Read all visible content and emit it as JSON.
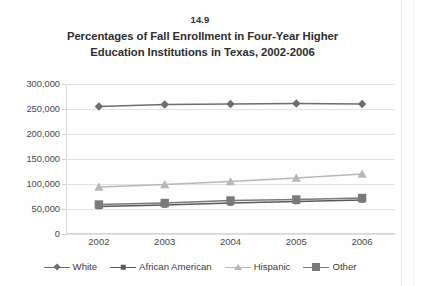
{
  "figure_number": "14.9",
  "chart_data": {
    "type": "line",
    "title": "Percentages of Fall Enrollment in Four-Year Higher Education Institutions in Texas, 2002-2006",
    "title_line1": "Percentages of Fall Enrollment in Four-Year Higher",
    "title_line2": "Education Institutions in Texas, 2002-2006",
    "xlabel": "",
    "ylabel": "",
    "categories": [
      "2002",
      "2003",
      "2004",
      "2005",
      "2006"
    ],
    "x": [
      2002,
      2003,
      2004,
      2005,
      2006
    ],
    "ylim": [
      0,
      300000
    ],
    "ytick_values": [
      0,
      50000,
      100000,
      150000,
      200000,
      250000,
      300000
    ],
    "ytick_labels": [
      "0",
      "50,000",
      "100,000",
      "150,000",
      "200,000",
      "250,000",
      "300,000"
    ],
    "grid": true,
    "legend_position": "bottom",
    "series": [
      {
        "name": "White",
        "marker": "diamond",
        "color": "#6e6e6e",
        "values": [
          255000,
          259000,
          260000,
          261000,
          260000
        ]
      },
      {
        "name": "African American",
        "marker": "square-small",
        "color": "#5a5a5a",
        "values": [
          55000,
          58000,
          62000,
          65000,
          68000
        ]
      },
      {
        "name": "Hispanic",
        "marker": "triangle",
        "color": "#b8b8b8",
        "values": [
          94000,
          99000,
          105000,
          112000,
          120000
        ]
      },
      {
        "name": "Other",
        "marker": "square-large",
        "color": "#7a7a7a",
        "values": [
          59000,
          62000,
          67000,
          69000,
          72000
        ]
      }
    ]
  },
  "legend": {
    "items": [
      {
        "label": "White",
        "marker": "diamond",
        "color": "#6e6e6e"
      },
      {
        "label": "African American",
        "marker": "square-small",
        "color": "#5a5a5a"
      },
      {
        "label": "Hispanic",
        "marker": "triangle",
        "color": "#b8b8b8"
      },
      {
        "label": "Other",
        "marker": "square-large",
        "color": "#7a7a7a"
      }
    ]
  },
  "colors": {
    "gridline": "#e2e2e2",
    "axis": "#d6d6d6",
    "text": "#3b3b3b",
    "background": "#fefefe"
  }
}
